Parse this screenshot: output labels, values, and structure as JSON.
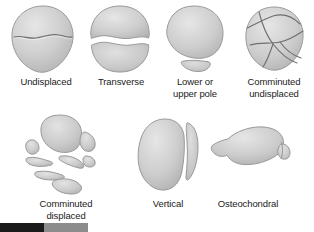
{
  "figure": {
    "background_color": "#ffffff",
    "bone_fill": "#c9c9c9",
    "bone_edge": "#9a9a9a",
    "bone_highlight": "#e2e2e2",
    "fracture_line_color": "#6f6f6f",
    "caption_color": "#1b1b1b"
  },
  "items": [
    {
      "id": "undisplaced",
      "label": "Undisplaced",
      "row": 1,
      "column": 1,
      "description": "Patella with a single thin transverse fracture line, no separation"
    },
    {
      "id": "transverse",
      "label": "Transverse",
      "row": 1,
      "column": 2,
      "description": "Patella split horizontally into two separated halves with a gap"
    },
    {
      "id": "lower-or-upper-pole",
      "label": "Lower or\nupper pole",
      "row": 1,
      "column": 3,
      "description": "Large main body with a small separated pole fragment below"
    },
    {
      "id": "comminuted-undisplaced",
      "label": "Comminuted\nundisplaced",
      "row": 1,
      "column": 4,
      "description": "Multiple intersecting crack lines, fragments remain in place"
    },
    {
      "id": "comminuted-displaced",
      "label": "Comminuted\ndisplaced",
      "row": 2,
      "column": 1,
      "description": "Multiple bone fragments separated apart with wide gaps"
    },
    {
      "id": "vertical",
      "label": "Vertical",
      "row": 2,
      "column": 2,
      "description": "Patella split vertically with a narrow lateral fragment"
    },
    {
      "id": "osteochondral",
      "label": "Osteochondral",
      "row": 2,
      "column": 3,
      "description": "Lateral profile view with a small chipped osteochondral fragment"
    }
  ],
  "legend_bar": {
    "segments": [
      {
        "id": "segment-dark",
        "color": "#1a1a1a"
      },
      {
        "id": "segment-gray",
        "color": "#8c8c8c"
      }
    ]
  }
}
